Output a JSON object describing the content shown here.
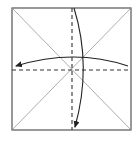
{
  "diagram": {
    "type": "origami-fold-diagram",
    "caption": "Square paper with diagonal creases; valley-fold horizontally and vertically (fold top to bottom, right to left)",
    "colors": {
      "background": "#ffffff",
      "border": "#555555",
      "crease": "#8a8a8a",
      "fold_line": "#333333",
      "arrow": "#222222"
    },
    "square": {
      "x": 12,
      "y": 8,
      "width": 119,
      "height": 122
    },
    "creases": [
      {
        "name": "diagonal-tl-br",
        "style": "solid-thin"
      },
      {
        "name": "diagonal-tr-bl",
        "style": "solid-thin"
      }
    ],
    "fold_lines": [
      {
        "name": "vertical-valley-fold",
        "style": "dashed"
      },
      {
        "name": "horizontal-valley-fold",
        "style": "dashed"
      }
    ],
    "arrows": [
      {
        "name": "fold-arrow-top-to-bottom",
        "direction": "down"
      },
      {
        "name": "fold-arrow-right-to-left",
        "direction": "left"
      }
    ]
  }
}
